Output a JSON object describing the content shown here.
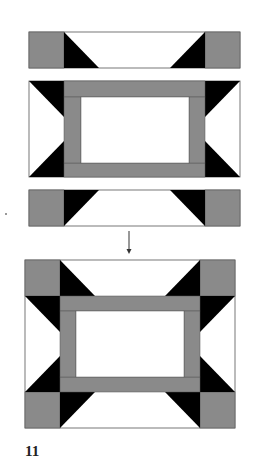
{
  "figure": {
    "step_label": "11",
    "colors": {
      "gray_fabric": "#8a8a8a",
      "dark_fabric": "#000000",
      "light_fabric": "#ffffff",
      "outline": "#555555"
    },
    "parts": [
      {
        "name": "top-strip",
        "pieces": [
          "gray-square",
          "flying-goose",
          "gray-square"
        ]
      },
      {
        "name": "middle-unit",
        "pieces": [
          "half-square-goose-left",
          "framed-center",
          "half-square-goose-right"
        ]
      },
      {
        "name": "bottom-strip",
        "pieces": [
          "gray-square",
          "flying-goose",
          "gray-square"
        ]
      },
      {
        "name": "assembled-block",
        "pieces": [
          "top-strip",
          "middle-unit",
          "bottom-strip"
        ]
      }
    ],
    "arrow": {
      "direction": "down"
    }
  }
}
